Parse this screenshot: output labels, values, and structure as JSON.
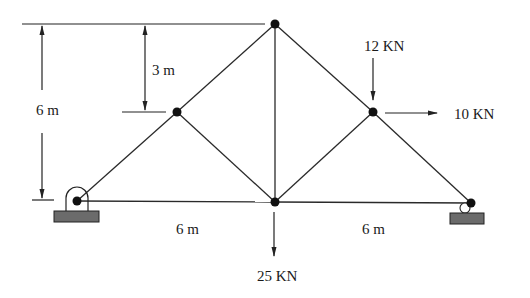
{
  "figure": {
    "type": "truss",
    "nodes": [
      {
        "id": "A",
        "name": "bottom-left-support",
        "x": 77,
        "y": 201
      },
      {
        "id": "B",
        "name": "left-mid",
        "x": 177,
        "y": 112
      },
      {
        "id": "C",
        "name": "top",
        "x": 275,
        "y": 24
      },
      {
        "id": "D",
        "name": "right-mid",
        "x": 373,
        "y": 112
      },
      {
        "id": "E",
        "name": "bottom-right-support",
        "x": 471,
        "y": 203
      },
      {
        "id": "F",
        "name": "bottom-center",
        "x": 275,
        "y": 202
      }
    ],
    "members": [
      [
        "A",
        "B"
      ],
      [
        "B",
        "C"
      ],
      [
        "C",
        "D"
      ],
      [
        "D",
        "E"
      ],
      [
        "A",
        "F"
      ],
      [
        "F",
        "E"
      ],
      [
        "C",
        "F"
      ],
      [
        "B",
        "F"
      ],
      [
        "D",
        "F"
      ]
    ],
    "supports": [
      {
        "node": "A",
        "kind": "pin"
      },
      {
        "node": "E",
        "kind": "roller"
      }
    ]
  },
  "dimensions": {
    "height_total": "6 m",
    "height_upper": "3 m",
    "span_left": "6 m",
    "span_right": "6 m"
  },
  "loads": {
    "vertical_top_right": "12 KN",
    "horizontal_right": "10 KN",
    "vertical_bottom_center": "25 KN"
  },
  "colors": {
    "line": "#2a2a2a",
    "node": "#111111",
    "ground": "#6b6b6b"
  }
}
